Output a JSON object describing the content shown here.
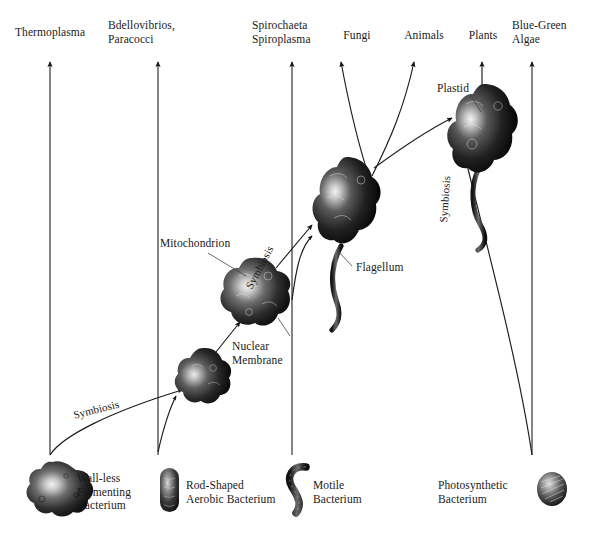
{
  "figure": {
    "type": "diagram",
    "background_color": "#ffffff",
    "ink_color": "#1a1a1a"
  },
  "top_labels": {
    "thermoplasma": "Thermoplasma",
    "bdellovibrios": "Bdellovibrios,\nParacocci",
    "spirochaeta": "Spirochaeta\nSpiroplasma",
    "fungi": "Fungi",
    "animals": "Animals",
    "plants": "Plants",
    "blue_green_algae": "Blue-Green\nAlgae"
  },
  "bottom_labels": {
    "wall_less": "Wall-less\nFermenting\nBacterium",
    "rod_shaped": "Rod-Shaped\nAerobic Bacterium",
    "motile": "Motile\nBacterium",
    "photosynthetic": "Photosynthetic\nBacterium"
  },
  "interior_labels": {
    "plastid": "Plastid",
    "flagellum": "Flagellum",
    "mitochondrion": "Mitochondrion",
    "nuclear_membrane": "Nuclear\nMembrane"
  },
  "symbiosis_labels": {
    "left": "Symbiosis",
    "middle": "Symbiosis",
    "right": "Symbiosis"
  },
  "lineages": [
    {
      "name": "Thermoplasma",
      "axis_x": 50
    },
    {
      "name": "Bdellovibrios, Paracocci",
      "axis_x": 158
    },
    {
      "name": "Spirochaeta Spiroplasma",
      "axis_x": 292
    },
    {
      "name": "Blue-Green Algae",
      "axis_x": 532
    }
  ],
  "cells": [
    {
      "name": "wall-less-fermenting-bacterium",
      "shape": "blob",
      "x": 52,
      "y": 490
    },
    {
      "name": "rod-shaped-aerobic-bacterium",
      "shape": "rod",
      "x": 169,
      "y": 490
    },
    {
      "name": "motile-bacterium",
      "shape": "spirochete",
      "x": 295,
      "y": 489
    },
    {
      "name": "photosynthetic-bacterium",
      "shape": "coccus",
      "x": 552,
      "y": 489
    },
    {
      "name": "early-amoeboid-cell",
      "shape": "blob",
      "x": 203,
      "y": 379
    },
    {
      "name": "nucleated-cell-with-mitochondria",
      "shape": "blob",
      "x": 252,
      "y": 295
    },
    {
      "name": "flagellated-eukaryotic-cell",
      "shape": "flagellate",
      "x": 347,
      "y": 190
    },
    {
      "name": "plant-cell-with-plastid",
      "shape": "flagellate",
      "x": 484,
      "y": 115
    }
  ]
}
